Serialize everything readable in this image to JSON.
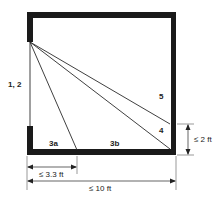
{
  "diagram": {
    "type": "room-plan-sightlines",
    "colors": {
      "wall": "#1a1a1a",
      "line": "#2a2a2a",
      "background": "#ffffff"
    },
    "labels": {
      "origin": "1, 2",
      "line_5": "5",
      "line_4": "4",
      "segment_3a": "3a",
      "segment_3b": "3b",
      "dim_height": "≤ 2 ft",
      "dim_short": "≤ 3.3 ft",
      "dim_long": "≤ 10 ft"
    }
  }
}
